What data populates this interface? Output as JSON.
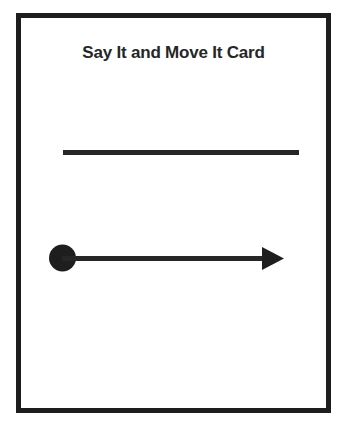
{
  "card": {
    "title": "Say It and Move It Card",
    "elements": [
      {
        "type": "writing-line",
        "description": "horizontal blank line for writing"
      },
      {
        "type": "arrow",
        "description": "left-to-right arrow starting with a filled dot",
        "start_marker": "dot",
        "end_marker": "arrowhead",
        "direction": "right"
      }
    ]
  },
  "colors": {
    "ink": "#262626",
    "border": "#1e1e1e",
    "background": "#ffffff"
  }
}
